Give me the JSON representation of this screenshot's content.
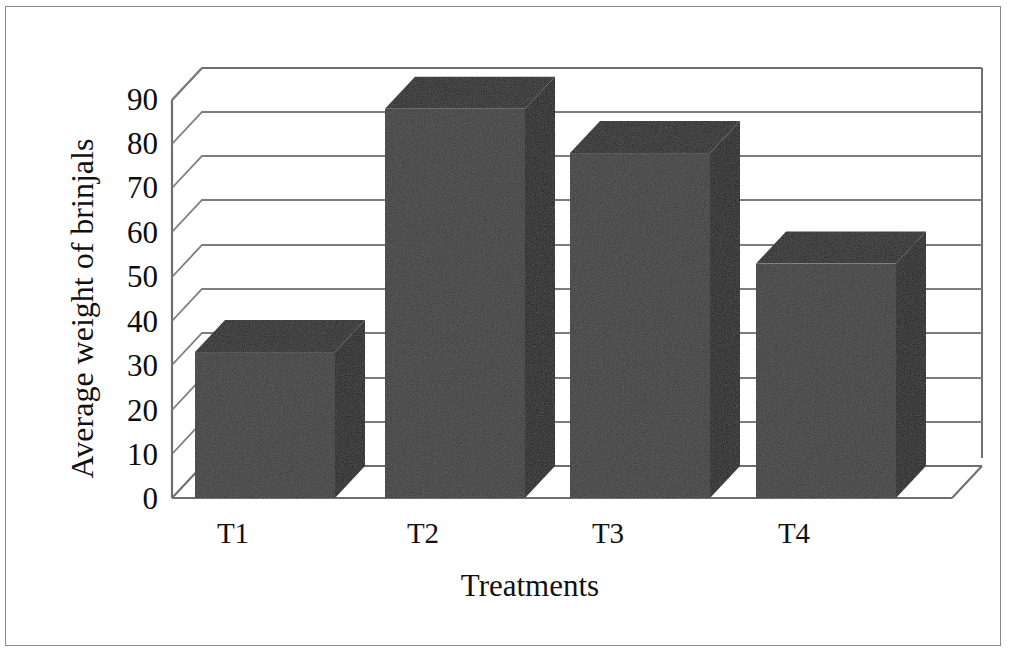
{
  "chart_data": {
    "type": "bar",
    "title": "",
    "subtitle": "",
    "xlabel": "Treatments",
    "ylabel": "Average weight of brinjals",
    "categories": [
      "T1",
      "T2",
      "T3",
      "T4"
    ],
    "values": [
      33,
      88,
      78,
      53
    ],
    "series": [
      {
        "name": "Average weight of brinjals",
        "values": [
          33,
          88,
          78,
          53
        ]
      }
    ],
    "ylim": [
      0,
      90
    ],
    "yticks": [
      0,
      10,
      20,
      30,
      40,
      50,
      60,
      70,
      80,
      90
    ],
    "ytick_labels": [
      "0",
      "10",
      "20",
      "30",
      "40",
      "50",
      "60",
      "70",
      "80",
      "90"
    ],
    "grid": true,
    "grid_axis": "y",
    "legend": false,
    "legend_position": "none",
    "style": "3d",
    "annotations": []
  },
  "axes": {
    "y_title": "Average weight of brinjals",
    "x_title": "Treatments",
    "y_labels": [
      "90",
      "80",
      "70",
      "60",
      "50",
      "40",
      "30",
      "20",
      "10",
      "0"
    ],
    "x_labels": [
      "T1",
      "T2",
      "T3",
      "T4"
    ]
  },
  "colors": {
    "bar_front": "#3a3a3a",
    "bar_side": "#1a1a1a",
    "bar_top": "#232323",
    "gridline": "#7d7d7d",
    "axis_line": "#6e6e6e",
    "frame": "#8a8a8a",
    "background": "#ffffff",
    "text": "#101010"
  }
}
